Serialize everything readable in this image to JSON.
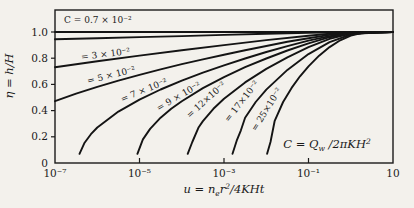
{
  "colors": {
    "paper": "#f3f1ec",
    "ink": "#1a1a1a"
  },
  "titles": {
    "y_axis": "η = h/H",
    "x_axis": {
      "p1": "u = n",
      "sub": "e",
      "p2": "r",
      "sup": "2",
      "p3": "/4KHt"
    },
    "legend_formula": {
      "p1": "C = Q",
      "sub": "w",
      "p2": " /2πKH",
      "sup": "2"
    }
  },
  "axes": {
    "x_ticks": [
      {
        "label": "10⁻⁷",
        "logu": -7,
        "tick": false
      },
      {
        "label": "10⁻⁵",
        "logu": -5,
        "tick": true
      },
      {
        "label": "10⁻³",
        "logu": -3,
        "tick": true
      },
      {
        "label": "10⁻¹",
        "logu": -1,
        "tick": true
      },
      {
        "label": "10",
        "logu": 1,
        "tick": false
      }
    ],
    "y_ticks": [
      {
        "label": "1.0",
        "eta": 1.0,
        "tick": true
      },
      {
        "label": "0.8",
        "eta": 0.8,
        "tick": true
      },
      {
        "label": "0.6",
        "eta": 0.6,
        "tick": true
      },
      {
        "label": "0.4",
        "eta": 0.4,
        "tick": true
      },
      {
        "label": "0.2",
        "eta": 0.2,
        "tick": true
      },
      {
        "label": "0",
        "eta": 0.0,
        "tick": false
      }
    ]
  },
  "chart_data": {
    "type": "line",
    "title": "",
    "xlabel": "u = n_e r^2 / 4KHt",
    "ylabel": "η = h/H",
    "x_scale": "log",
    "xlim": [
      1e-07,
      10
    ],
    "ylim": [
      0,
      1.0
    ],
    "x_log_range": [
      -7,
      1
    ],
    "grid": false,
    "annotation": "C = Q_w / 2πKH^2",
    "asymptote_eta": 1.0,
    "series": [
      {
        "name": "C = 0.7 × 10⁻²",
        "C": 0.007,
        "label": {
          "text": "C = 0.7 × 10⁻²",
          "x": 64,
          "y": 23,
          "rot": 0,
          "anchor": "start"
        },
        "points": [
          [
            -7,
            0.944
          ],
          [
            -6,
            0.953
          ],
          [
            -5,
            0.961
          ],
          [
            -4,
            0.969
          ],
          [
            -3,
            0.978
          ],
          [
            -2,
            0.986
          ],
          [
            -1,
            0.994
          ],
          [
            0,
            0.999
          ],
          [
            1,
            1.0
          ]
        ]
      },
      {
        "name": "C = 3 × 10⁻²",
        "C": 0.03,
        "label": {
          "text": "= 3 × 10⁻²",
          "x": 106,
          "y": 57,
          "rot": -7
        },
        "points": [
          [
            -7,
            0.731
          ],
          [
            -6,
            0.777
          ],
          [
            -5,
            0.82
          ],
          [
            -4,
            0.861
          ],
          [
            -3,
            0.9
          ],
          [
            -2,
            0.938
          ],
          [
            -1,
            0.972
          ],
          [
            -0.5,
            0.986
          ],
          [
            0,
            0.997
          ],
          [
            1,
            1.0
          ]
        ]
      },
      {
        "name": "C = 5 × 10⁻²",
        "C": 0.05,
        "label": {
          "text": "= 5 × 10⁻²",
          "x": 112,
          "y": 78,
          "rot": -14
        },
        "points": [
          [
            -7,
            0.472
          ],
          [
            -6.5,
            0.53
          ],
          [
            -6,
            0.582
          ],
          [
            -5.5,
            0.629
          ],
          [
            -5,
            0.673
          ],
          [
            -4.5,
            0.715
          ],
          [
            -4,
            0.754
          ],
          [
            -3.5,
            0.791
          ],
          [
            -3,
            0.827
          ],
          [
            -2.5,
            0.861
          ],
          [
            -2,
            0.893
          ],
          [
            -1.5,
            0.925
          ],
          [
            -1,
            0.953
          ],
          [
            -0.5,
            0.978
          ],
          [
            0,
            0.995
          ],
          [
            1,
            1.0
          ]
        ]
      },
      {
        "name": "C = 7 × 10⁻²",
        "C": 0.07,
        "label": {
          "text": "= 7 × 10⁻²",
          "x": 145,
          "y": 93,
          "rot": -22
        },
        "points": [
          [
            -6.42,
            0.07
          ],
          [
            -6.3,
            0.155
          ],
          [
            -6.15,
            0.22
          ],
          [
            -6,
            0.271
          ],
          [
            -5.5,
            0.392
          ],
          [
            -5,
            0.484
          ],
          [
            -4.5,
            0.561
          ],
          [
            -4,
            0.629
          ],
          [
            -3.5,
            0.69
          ],
          [
            -3,
            0.746
          ],
          [
            -2.5,
            0.798
          ],
          [
            -2,
            0.847
          ],
          [
            -1.5,
            0.892
          ],
          [
            -1,
            0.934
          ],
          [
            -0.5,
            0.969
          ],
          [
            0,
            0.992
          ],
          [
            1,
            1.0
          ]
        ]
      },
      {
        "name": "C = 9 × 10⁻²",
        "C": 0.09,
        "label": {
          "text": "= 9 × 10⁻²",
          "x": 180,
          "y": 99,
          "rot": -30
        },
        "points": [
          [
            -5.05,
            0.07
          ],
          [
            -4.92,
            0.18
          ],
          [
            -4.75,
            0.26
          ],
          [
            -4.5,
            0.346
          ],
          [
            -4.25,
            0.414
          ],
          [
            -4,
            0.472
          ],
          [
            -3.5,
            0.572
          ],
          [
            -3,
            0.656
          ],
          [
            -2.5,
            0.731
          ],
          [
            -2,
            0.798
          ],
          [
            -1.5,
            0.859
          ],
          [
            -1,
            0.914
          ],
          [
            -0.5,
            0.96
          ],
          [
            0,
            0.99
          ],
          [
            1,
            1.0
          ]
        ]
      },
      {
        "name": "C = 12 × 10⁻²",
        "C": 0.12,
        "label": {
          "text": "= 12×10⁻²",
          "x": 208,
          "y": 102,
          "rot": -42
        },
        "points": [
          [
            -3.86,
            0.07
          ],
          [
            -3.75,
            0.16
          ],
          [
            -3.6,
            0.273
          ],
          [
            -3.5,
            0.32
          ],
          [
            -3.25,
            0.414
          ],
          [
            -3,
            0.49
          ],
          [
            -2.5,
            0.615
          ],
          [
            -2,
            0.718
          ],
          [
            -1.5,
            0.807
          ],
          [
            -1,
            0.884
          ],
          [
            -0.5,
            0.947
          ],
          [
            0,
            0.987
          ],
          [
            1,
            1.0
          ]
        ]
      },
      {
        "name": "C = 17 × 10⁻²",
        "C": 0.17,
        "label": {
          "text": "= 17×10⁻²",
          "x": 244,
          "y": 103,
          "rot": -52
        },
        "points": [
          [
            -2.8,
            0.07
          ],
          [
            -2.7,
            0.17
          ],
          [
            -2.6,
            0.25
          ],
          [
            -2.5,
            0.346
          ],
          [
            -2.25,
            0.466
          ],
          [
            -2,
            0.56
          ],
          [
            -1.5,
            0.711
          ],
          [
            -1,
            0.831
          ],
          [
            -0.5,
            0.923
          ],
          [
            0,
            0.981
          ],
          [
            0.5,
            0.998
          ],
          [
            1,
            1.0
          ]
        ]
      },
      {
        "name": "C = 25 × 10⁻²",
        "C": 0.25,
        "label": {
          "text": "= 25×10⁻²",
          "x": 269,
          "y": 111,
          "rot": -58
        },
        "points": [
          [
            -1.98,
            0.07
          ],
          [
            -1.9,
            0.16
          ],
          [
            -1.8,
            0.322
          ],
          [
            -1.6,
            0.466
          ],
          [
            -1.4,
            0.573
          ],
          [
            -1.2,
            0.662
          ],
          [
            -1,
            0.738
          ],
          [
            -0.75,
            0.819
          ],
          [
            -0.5,
            0.885
          ],
          [
            -0.25,
            0.937
          ],
          [
            0,
            0.972
          ],
          [
            0.25,
            0.992
          ],
          [
            0.5,
            0.997
          ],
          [
            1,
            1.0
          ]
        ]
      }
    ]
  }
}
